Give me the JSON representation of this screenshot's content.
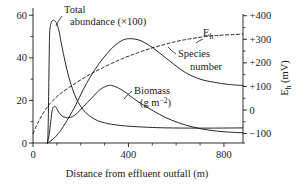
{
  "chart_data": {
    "type": "line",
    "title": "",
    "xlabel": "Distance from effluent outfall (m)",
    "ylabel_left": "",
    "ylabel_right": "Eh (mV)",
    "ylabel_right_base": "E",
    "ylabel_right_sub": "h",
    "ylabel_right_unit": "(mV)",
    "xlim": [
      0,
      880
    ],
    "ylim_left": [
      0,
      62
    ],
    "ylim_right": [
      -140,
      420
    ],
    "grid": false,
    "legend_position": "inline-annotations",
    "x_ticks_major": [
      0,
      400,
      800
    ],
    "x_ticks_major_labels": [
      "0",
      "400",
      "800"
    ],
    "x_ticks_minor": [
      100,
      200,
      300,
      500,
      600,
      700
    ],
    "y_ticks_left_major": [
      0,
      20,
      40,
      60
    ],
    "y_ticks_left_major_labels": [
      "0",
      "20",
      "40",
      "60"
    ],
    "y_ticks_left_minor": [
      10,
      30,
      50
    ],
    "y_ticks_right_major": [
      -100,
      0,
      100,
      200,
      300,
      400
    ],
    "y_ticks_right_major_labels": [
      "-100",
      "0",
      "+100",
      "+200",
      "+300",
      "+400"
    ],
    "y_ticks_right_minor": [
      -50,
      50,
      150,
      250,
      350
    ],
    "series": [
      {
        "name": "Total abundance (×100)",
        "label_line1": "Total",
        "label_line2": "abundance (×100)",
        "axis": "left",
        "style": "solid",
        "color": "#1a1a1a",
        "points": [
          [
            60,
            0
          ],
          [
            62,
            2
          ],
          [
            64,
            10
          ],
          [
            66,
            26
          ],
          [
            68,
            42
          ],
          [
            70,
            52
          ],
          [
            75,
            56
          ],
          [
            82,
            57.5
          ],
          [
            90,
            57.5
          ],
          [
            100,
            56
          ],
          [
            110,
            52
          ],
          [
            120,
            46
          ],
          [
            135,
            38
          ],
          [
            150,
            31
          ],
          [
            170,
            24
          ],
          [
            190,
            19
          ],
          [
            215,
            15
          ],
          [
            240,
            12.5
          ],
          [
            270,
            10.5
          ],
          [
            300,
            9.5
          ],
          [
            340,
            8.6
          ],
          [
            400,
            7.9
          ],
          [
            480,
            7.4
          ],
          [
            560,
            7.1
          ],
          [
            660,
            7.0
          ],
          [
            760,
            7.0
          ],
          [
            880,
            7.1
          ]
        ]
      },
      {
        "name": "Species number",
        "label_line1": "Species",
        "label_line2": "number",
        "axis": "left",
        "style": "solid",
        "color": "#1a1a1a",
        "points": [
          [
            60,
            0
          ],
          [
            75,
            1
          ],
          [
            95,
            3
          ],
          [
            120,
            6.5
          ],
          [
            150,
            12
          ],
          [
            180,
            18
          ],
          [
            210,
            25
          ],
          [
            240,
            31
          ],
          [
            275,
            37
          ],
          [
            310,
            42
          ],
          [
            345,
            46
          ],
          [
            380,
            48.5
          ],
          [
            410,
            49
          ],
          [
            440,
            48.5
          ],
          [
            470,
            47
          ],
          [
            505,
            44.5
          ],
          [
            545,
            41
          ],
          [
            590,
            37
          ],
          [
            640,
            33
          ],
          [
            700,
            30
          ],
          [
            760,
            28.5
          ],
          [
            820,
            27.5
          ],
          [
            880,
            27
          ]
        ]
      },
      {
        "name": "Biomass (g m-2)",
        "label_line1": "Biomass",
        "label_line2": "(g m",
        "label_sup": "−2",
        "label_line2_end": ")",
        "axis": "left",
        "style": "solid",
        "color": "#1a1a1a",
        "points": [
          [
            60,
            0
          ],
          [
            68,
            4
          ],
          [
            74,
            10
          ],
          [
            80,
            15
          ],
          [
            86,
            17
          ],
          [
            95,
            17
          ],
          [
            105,
            15
          ],
          [
            118,
            13
          ],
          [
            135,
            12
          ],
          [
            155,
            12
          ],
          [
            180,
            13.5
          ],
          [
            210,
            17
          ],
          [
            245,
            21
          ],
          [
            280,
            25
          ],
          [
            310,
            26.8
          ],
          [
            330,
            27
          ],
          [
            355,
            26
          ],
          [
            385,
            24
          ],
          [
            420,
            21
          ],
          [
            460,
            18
          ],
          [
            505,
            15
          ],
          [
            555,
            12
          ],
          [
            610,
            9.5
          ],
          [
            670,
            7.5
          ],
          [
            740,
            6
          ],
          [
            810,
            5.2
          ],
          [
            880,
            4.8
          ]
        ]
      },
      {
        "name": "Eh",
        "label": "Eh",
        "label_base": "E",
        "label_sub": "h",
        "axis": "right",
        "style": "dashed",
        "color": "#1a1a1a",
        "points": [
          [
            0,
            -100
          ],
          [
            20,
            -55
          ],
          [
            45,
            -10
          ],
          [
            70,
            25
          ],
          [
            95,
            52
          ],
          [
            120,
            73
          ],
          [
            150,
            95
          ],
          [
            185,
            118
          ],
          [
            220,
            140
          ],
          [
            255,
            160
          ],
          [
            290,
            178
          ],
          [
            330,
            198
          ],
          [
            370,
            216
          ],
          [
            410,
            232
          ],
          [
            450,
            247
          ],
          [
            495,
            262
          ],
          [
            540,
            275
          ],
          [
            585,
            287
          ],
          [
            635,
            298
          ],
          [
            690,
            307
          ],
          [
            745,
            314
          ],
          [
            800,
            318
          ],
          [
            880,
            322
          ]
        ]
      }
    ],
    "annotations": [
      {
        "name": "total-abundance-label",
        "x": 75,
        "y": 60
      },
      {
        "name": "species-number-label",
        "x": 650,
        "y": 44
      },
      {
        "name": "biomass-label",
        "x": 470,
        "y": 24
      },
      {
        "name": "eh-label",
        "x": 620,
        "y": 56
      }
    ]
  }
}
